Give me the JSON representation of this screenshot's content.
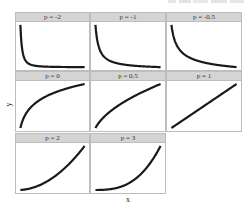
{
  "chart_data": {
    "type": "line",
    "title": "",
    "xlabel": "x",
    "ylabel": "y",
    "grid": false,
    "legend": "none",
    "layout": "faceted 3x3 (8 panels), free y scales, no tick labels",
    "line_color": "#1a1a1a",
    "strip_color": "#d4d4d4",
    "panels": [
      {
        "label": "p = -2",
        "p": -2,
        "shape": "steep decreasing, x^p"
      },
      {
        "label": "p = -1",
        "p": -1,
        "shape": "decreasing, x^p"
      },
      {
        "label": "p = -0.5",
        "p": -0.5,
        "shape": "gradual decreasing, x^p"
      },
      {
        "label": "p = 0",
        "p": 0,
        "shape": "logarithmic increasing"
      },
      {
        "label": "p = 0.5",
        "p": 0.5,
        "shape": "concave increasing"
      },
      {
        "label": "p = 1",
        "p": 1,
        "shape": "linear increasing"
      },
      {
        "label": "p = 2",
        "p": 2,
        "shape": "convex increasing"
      },
      {
        "label": "p = 3",
        "p": 3,
        "shape": "strongly convex increasing"
      }
    ]
  },
  "axes": {
    "x": "x",
    "y": "y"
  }
}
